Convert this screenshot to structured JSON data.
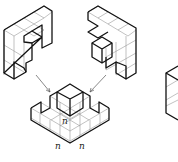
{
  "figure": {
    "labels": [
      {
        "id": "n-vertical",
        "text": "n"
      },
      {
        "id": "n-left",
        "text": "n"
      },
      {
        "id": "n-right",
        "text": "n"
      }
    ],
    "colors": {
      "stroke": "#111111",
      "grid": "#888888",
      "arrow": "#555555",
      "background": "#ffffff"
    }
  }
}
